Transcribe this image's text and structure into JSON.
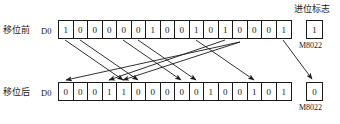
{
  "figure": {
    "type": "plc-rotate-shift-diagram",
    "before": {
      "row_label": "移位前",
      "register_label": "D0",
      "bits": [
        "1",
        "0",
        "0",
        "0",
        "0",
        "0",
        "1",
        "0",
        "0",
        "1",
        "0",
        "1",
        "0",
        "0",
        "0",
        "1"
      ],
      "carry_value": "1",
      "carry_device": "M8022"
    },
    "after": {
      "row_label": "移位后",
      "register_label": "D0",
      "bits": [
        "0",
        "0",
        "0",
        "1",
        "1",
        "0",
        "0",
        "0",
        "0",
        "0",
        "1",
        "0",
        "0",
        "1",
        "0",
        "1"
      ],
      "carry_value": "0",
      "carry_device": "M8022"
    },
    "carry_title": "进位标志",
    "colors": {
      "ink": "#1a1a1a",
      "paper": "#ffffff"
    },
    "arrows": [
      {
        "from_bit": 1,
        "to_bit": 5
      },
      {
        "from_bit": 2,
        "to_bit": 6
      },
      {
        "from_bit": 5,
        "to_bit": 9
      },
      {
        "from_bit": 6,
        "to_bit": 10
      },
      {
        "from_bit": 10,
        "to_bit": 14
      },
      {
        "from_bit": 12,
        "to_bit": 4
      },
      {
        "from_bit": 13,
        "to_bit": 1
      },
      {
        "from_bit": 13,
        "to_bit": 5
      },
      {
        "from_bit": 16,
        "to_carry": true
      }
    ]
  }
}
